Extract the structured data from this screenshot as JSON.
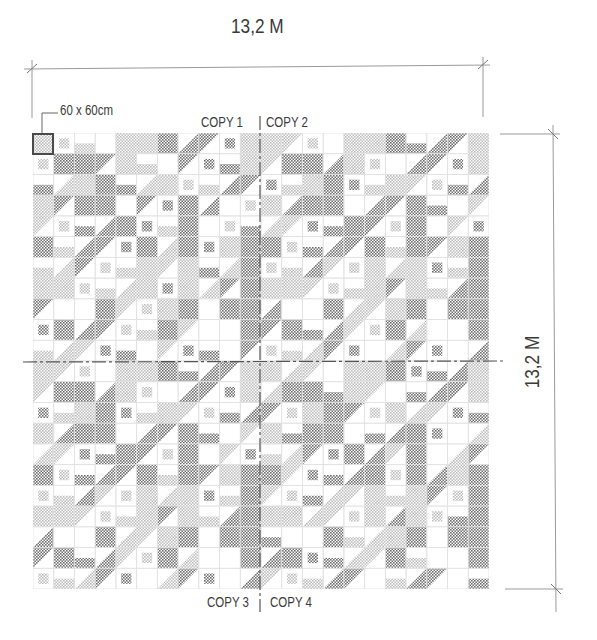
{
  "drawing": {
    "width_dimension": "13,2 M",
    "height_dimension": "13,2 M",
    "tile_size_note": "60 x 60cm",
    "copies": [
      {
        "label": "COPY 1"
      },
      {
        "label": "COPY 2"
      },
      {
        "label": "COPY 3"
      },
      {
        "label": "COPY 4"
      }
    ],
    "tiles_per_side": 22,
    "quadrant_tiles_per_side": 11,
    "tile_legend": {
      "0": "empty",
      "1": "light-full",
      "2": "dark-full",
      "3": "light-partial",
      "4": "dark-partial"
    },
    "colors": {
      "line": "#8a8a8a",
      "grid": "#e2e2e2",
      "dark_dot": "#6f6f6f",
      "light_dot": "#bdbdbd",
      "text": "#3a3a3a",
      "highlight_border": "#4a4a4a"
    },
    "quadrant_pattern": [
      [
        1,
        3,
        3,
        0,
        1,
        1,
        2,
        4,
        4,
        4,
        1
      ],
      [
        3,
        2,
        2,
        4,
        1,
        3,
        0,
        4,
        4,
        4,
        1
      ],
      [
        4,
        3,
        1,
        2,
        4,
        3,
        1,
        3,
        3,
        4,
        4
      ],
      [
        1,
        4,
        2,
        2,
        0,
        4,
        4,
        2,
        4,
        0,
        3
      ],
      [
        3,
        3,
        4,
        4,
        2,
        4,
        3,
        2,
        0,
        3,
        4
      ],
      [
        2,
        3,
        4,
        4,
        4,
        2,
        3,
        2,
        4,
        1,
        2
      ],
      [
        3,
        3,
        4,
        3,
        3,
        1,
        3,
        1,
        4,
        3,
        2
      ],
      [
        1,
        1,
        3,
        3,
        3,
        1,
        4,
        1,
        3,
        4,
        2
      ],
      [
        4,
        0,
        0,
        2,
        3,
        3,
        1,
        2,
        0,
        2,
        2
      ],
      [
        4,
        2,
        4,
        4,
        3,
        3,
        2,
        3,
        0,
        0,
        2
      ],
      [
        3,
        3,
        3,
        4,
        4,
        0,
        3,
        4,
        4,
        0,
        4
      ]
    ]
  }
}
